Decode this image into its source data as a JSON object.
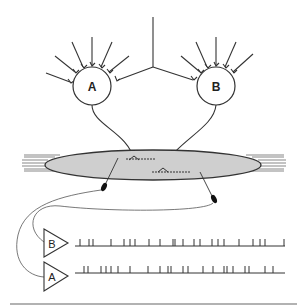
{
  "diagram": {
    "neurons": [
      {
        "id": "A",
        "label": "A",
        "cx": 92,
        "cy": 86,
        "r": 19
      },
      {
        "id": "B",
        "label": "B",
        "cx": 216,
        "cy": 86,
        "r": 19
      }
    ],
    "muscle_fiber": {
      "cx": 153,
      "cy": 165,
      "rx": 108,
      "ry": 15,
      "fill": "#cfcfcf",
      "stroke": "#333333"
    },
    "amplifiers": [
      {
        "id": "B",
        "label": "B",
        "x": 44,
        "y": 242
      },
      {
        "id": "A",
        "label": "A",
        "x": 44,
        "y": 277
      }
    ],
    "spike_trains": {
      "B": {
        "baseline_y": 246,
        "x_start": 75,
        "x_end": 285,
        "spikes": [
          80,
          89,
          93,
          111,
          124,
          130,
          135,
          149,
          160,
          173,
          175,
          183,
          194,
          200,
          212,
          218,
          224,
          239,
          253,
          260,
          265,
          284
        ]
      },
      "A": {
        "baseline_y": 273,
        "x_start": 75,
        "x_end": 285,
        "spikes": [
          84,
          88,
          101,
          106,
          111,
          118,
          130,
          148,
          160,
          168,
          171,
          183,
          188,
          203,
          213,
          224,
          227,
          233,
          245,
          249,
          265,
          273
        ]
      }
    },
    "colors": {
      "line": "#333333",
      "fiber": "#cfcfcf",
      "bottom_rule": "#999999"
    }
  }
}
